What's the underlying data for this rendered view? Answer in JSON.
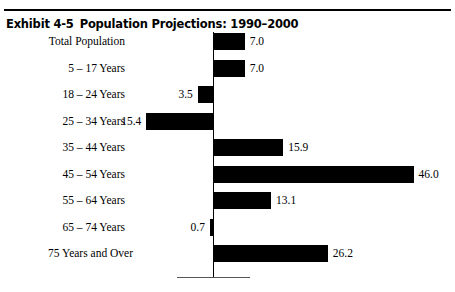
{
  "header": {
    "exhibit_number": "Exhibit 4-5",
    "title": "Population Projections: 1990–2000"
  },
  "chart_data": {
    "type": "bar",
    "orientation": "horizontal",
    "title": "Population Projections: 1990–2000",
    "xlabel": "",
    "ylabel": "",
    "grid": false,
    "legend": false,
    "axis_zero_line": true,
    "xlim": [
      -20,
      50
    ],
    "categories": [
      "Total Population",
      "5 – 17 Years",
      "18 – 24 Years",
      "25 – 34 Years",
      "35 – 44 Years",
      "45 – 54 Years",
      "55 – 64 Years",
      "65 – 74 Years",
      "75 Years and Over"
    ],
    "values": [
      7.0,
      7.0,
      -3.5,
      -15.4,
      15.9,
      46.0,
      13.1,
      -0.7,
      26.2
    ],
    "data_labels": [
      "7.0",
      "7.0",
      "3.5",
      "15.4",
      "15.9",
      "46.0",
      "13.1",
      "0.7",
      "26.2"
    ],
    "bar_color": "#000000"
  }
}
